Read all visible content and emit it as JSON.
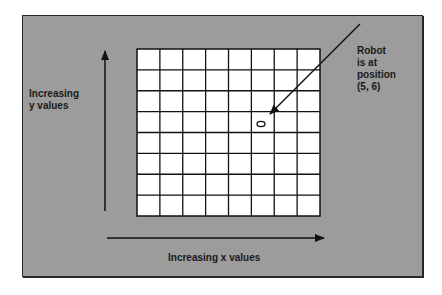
{
  "diagram": {
    "type": "grid-coordinate-illustration",
    "grid": {
      "columns": 8,
      "rows": 8
    },
    "robot": {
      "position": [
        5,
        6
      ],
      "marker": "ellipse"
    },
    "colors": {
      "background": "#9c9c9c",
      "grid_fill": "#ffffff",
      "lines": "#111111"
    }
  },
  "labels": {
    "y_axis": "Increasing\ny values",
    "x_axis": "Increasing x values",
    "robot_callout": "Robot\nis at\nposition\n(5, 6)"
  }
}
